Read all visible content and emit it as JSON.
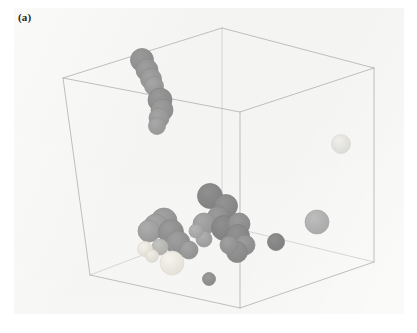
{
  "figure": {
    "panel_label": "(a)",
    "caption_visible": false,
    "background_color": "#f4f4f2",
    "page_color": "#ffffff"
  },
  "bounding_box": {
    "name": "simulation-cell",
    "edge_color": "#b8b9b6",
    "hidden_edge_color": "#cdcecb",
    "vertices": {
      "top_back": [
        222,
        28
      ],
      "top_left": [
        63,
        78
      ],
      "top_right": [
        374,
        68
      ],
      "top_front": [
        240,
        112
      ],
      "bottom_left": [
        90,
        275
      ],
      "bottom_right": [
        374,
        262
      ],
      "bottom_front": [
        240,
        308
      ],
      "bottom_back": [
        222,
        225
      ]
    },
    "visible_edges": [
      [
        "top_back",
        "top_left"
      ],
      [
        "top_back",
        "top_right"
      ],
      [
        "top_left",
        "top_front"
      ],
      [
        "top_right",
        "top_front"
      ],
      [
        "top_left",
        "bottom_left"
      ],
      [
        "top_right",
        "bottom_right"
      ],
      [
        "top_front",
        "bottom_front"
      ],
      [
        "bottom_left",
        "bottom_front"
      ],
      [
        "bottom_right",
        "bottom_front"
      ]
    ],
    "hidden_edges": [
      [
        "top_back",
        "bottom_back"
      ],
      [
        "bottom_back",
        "bottom_left"
      ],
      [
        "bottom_back",
        "bottom_right"
      ]
    ]
  },
  "chart_data": {
    "type": "scatter",
    "title": "",
    "xlabel": "",
    "ylabel": "",
    "projection": "3d-orthographic-cube",
    "particle_count": 34,
    "color_classes": {
      "dark_gray": "#8e8e8e",
      "mid_gray": "#9c9c9c",
      "light_gray": "#b9b9b9",
      "pale_gray": "#d3d3d3",
      "near_white": "#f2f0e9",
      "outline": "#7d7d7d"
    },
    "clusters": [
      {
        "name": "upper-left-cluster",
        "count": 8
      },
      {
        "name": "central-cluster",
        "count": 20
      },
      {
        "name": "right-isolated",
        "count": 3
      },
      {
        "name": "bottom-isolated",
        "count": 3
      }
    ],
    "particles": [
      {
        "id": 1,
        "cx": 142,
        "cy": 60,
        "r": 11.5,
        "fill": "#9a9a9a",
        "stroke": "#8a8a8a"
      },
      {
        "id": 2,
        "cx": 147,
        "cy": 70,
        "r": 11.0,
        "fill": "#9e9e9e",
        "stroke": "#8c8c8c"
      },
      {
        "id": 3,
        "cx": 151,
        "cy": 79,
        "r": 10.5,
        "fill": "#a2a2a2",
        "stroke": "#8f8f8f"
      },
      {
        "id": 4,
        "cx": 154,
        "cy": 86,
        "r": 9.5,
        "fill": "#a6a6a6",
        "stroke": "#919191"
      },
      {
        "id": 5,
        "cx": 160,
        "cy": 100,
        "r": 12.0,
        "fill": "#999999",
        "stroke": "#878787"
      },
      {
        "id": 6,
        "cx": 162,
        "cy": 110,
        "r": 11.0,
        "fill": "#9d9d9d",
        "stroke": "#8b8b8b"
      },
      {
        "id": 7,
        "cx": 159,
        "cy": 118,
        "r": 10.0,
        "fill": "#a4a4a4",
        "stroke": "#909090"
      },
      {
        "id": 8,
        "cx": 157,
        "cy": 126,
        "r": 8.5,
        "fill": "#a9a9a9",
        "stroke": "#949494"
      },
      {
        "id": 9,
        "cx": 341,
        "cy": 144,
        "r": 9.5,
        "fill": "#f0efea",
        "stroke": "#d8d8d4"
      },
      {
        "id": 10,
        "cx": 210,
        "cy": 196,
        "r": 12.5,
        "fill": "#909090",
        "stroke": "#7f7f7f"
      },
      {
        "id": 11,
        "cx": 226,
        "cy": 206,
        "r": 11.5,
        "fill": "#949494",
        "stroke": "#828282"
      },
      {
        "id": 12,
        "cx": 218,
        "cy": 217,
        "r": 10.5,
        "fill": "#9b9b9b",
        "stroke": "#888888"
      },
      {
        "id": 13,
        "cx": 204,
        "cy": 224,
        "r": 11.0,
        "fill": "#a8a8a8",
        "stroke": "#939393"
      },
      {
        "id": 14,
        "cx": 224,
        "cy": 228,
        "r": 12.5,
        "fill": "#8f8f8f",
        "stroke": "#7d7d7d"
      },
      {
        "id": 15,
        "cx": 239,
        "cy": 224,
        "r": 11.0,
        "fill": "#9a9a9a",
        "stroke": "#878787"
      },
      {
        "id": 16,
        "cx": 238,
        "cy": 236,
        "r": 11.5,
        "fill": "#929292",
        "stroke": "#808080"
      },
      {
        "id": 17,
        "cx": 245,
        "cy": 245,
        "r": 10.0,
        "fill": "#9d9d9d",
        "stroke": "#8a8a8a"
      },
      {
        "id": 18,
        "cx": 237,
        "cy": 252,
        "r": 10.5,
        "fill": "#979797",
        "stroke": "#858585"
      },
      {
        "id": 19,
        "cx": 229,
        "cy": 245,
        "r": 9.0,
        "fill": "#a0a0a0",
        "stroke": "#8c8c8c"
      },
      {
        "id": 20,
        "cx": 204,
        "cy": 239,
        "r": 8.0,
        "fill": "#b0b0b0",
        "stroke": "#999999"
      },
      {
        "id": 21,
        "cx": 164,
        "cy": 221,
        "r": 13.0,
        "fill": "#a3a3a3",
        "stroke": "#8e8e8e"
      },
      {
        "id": 22,
        "cx": 156,
        "cy": 226,
        "r": 12.0,
        "fill": "#a8a8a8",
        "stroke": "#929292"
      },
      {
        "id": 23,
        "cx": 149,
        "cy": 231,
        "r": 11.0,
        "fill": "#adadad",
        "stroke": "#969696"
      },
      {
        "id": 24,
        "cx": 171,
        "cy": 232,
        "r": 12.5,
        "fill": "#9b9b9b",
        "stroke": "#878787"
      },
      {
        "id": 25,
        "cx": 178,
        "cy": 243,
        "r": 12.0,
        "fill": "#9f9f9f",
        "stroke": "#8b8b8b"
      },
      {
        "id": 26,
        "cx": 160,
        "cy": 247,
        "r": 8.0,
        "fill": "#c3c3c0",
        "stroke": "#adadaa"
      },
      {
        "id": 27,
        "cx": 145,
        "cy": 249,
        "r": 7.5,
        "fill": "#f3f1e8",
        "stroke": "#dedcd4"
      },
      {
        "id": 28,
        "cx": 152,
        "cy": 256,
        "r": 6.5,
        "fill": "#efedE4",
        "stroke": "#dad8d0"
      },
      {
        "id": 29,
        "cx": 172,
        "cy": 263,
        "r": 12.0,
        "fill": "#f6f4ec",
        "stroke": "#e0ded5"
      },
      {
        "id": 30,
        "cx": 189,
        "cy": 250,
        "r": 9.0,
        "fill": "#a5a5a5",
        "stroke": "#8f8f8f"
      },
      {
        "id": 31,
        "cx": 276,
        "cy": 242,
        "r": 8.5,
        "fill": "#8f8f8f",
        "stroke": "#7d7d7d"
      },
      {
        "id": 32,
        "cx": 317,
        "cy": 222,
        "r": 12.0,
        "fill": "#bdbdbd",
        "stroke": "#a8a8a8"
      },
      {
        "id": 33,
        "cx": 209,
        "cy": 279,
        "r": 6.5,
        "fill": "#9b9b9b",
        "stroke": "#888888"
      },
      {
        "id": 34,
        "cx": 196,
        "cy": 231,
        "r": 7.0,
        "fill": "#b5b5b5",
        "stroke": "#9e9e9e"
      }
    ]
  }
}
